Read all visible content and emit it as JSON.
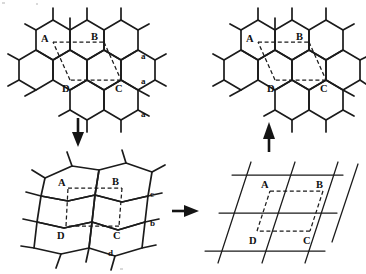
{
  "figure": {
    "background_color": "#ffffff",
    "line_color": "#1b1b1b",
    "dashed_color": "#1b1b1b",
    "label_color": "#111111"
  },
  "panels": [
    {
      "id": "top-left",
      "name": "honeycomb-lattice-regular",
      "cell_vertex_labels": [
        "A",
        "B",
        "C",
        "D"
      ],
      "edge_labels": [
        "a",
        "a",
        "a"
      ],
      "description": "Regular honeycomb net with dashed unit cell ABCD"
    },
    {
      "id": "top-right",
      "name": "honeycomb-lattice-regular-copy",
      "cell_vertex_labels": [
        "A",
        "B",
        "C",
        "D"
      ],
      "edge_labels": [],
      "description": "Regular honeycomb net with dashed unit cell ABCD"
    },
    {
      "id": "bottom-left",
      "name": "honeycomb-lattice-distorted",
      "cell_vertex_labels": [
        "A",
        "B",
        "C",
        "D"
      ],
      "edge_labels": [
        "c",
        "b",
        "d"
      ],
      "description": "Distorted honeycomb net with dashed unit cell ABCD"
    },
    {
      "id": "bottom-right",
      "name": "oblique-bravais-lattice",
      "cell_vertex_labels": [
        "A",
        "B",
        "C",
        "D"
      ],
      "edge_labels": [],
      "description": "Oblique lattice of straight lines with dashed unit cell ABCD"
    }
  ],
  "arrows": [
    {
      "name": "arrow-down-left",
      "direction": "down",
      "glyph": "↓"
    },
    {
      "name": "arrow-right-mid",
      "direction": "right",
      "glyph": "→"
    },
    {
      "name": "arrow-up-right",
      "direction": "up",
      "glyph": "↑"
    }
  ],
  "labels": {
    "A": "A",
    "B": "B",
    "C": "C",
    "D": "D",
    "a": "a",
    "b": "b",
    "c": "c",
    "d": "d"
  }
}
